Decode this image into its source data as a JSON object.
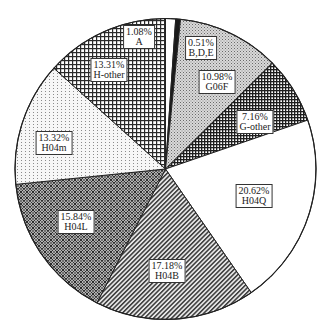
{
  "chart_data": {
    "type": "pie",
    "title": "",
    "start_angle_deg": 0,
    "direction": "clockwise",
    "categories": [
      "A",
      "B,D,E",
      "G06F",
      "G-other",
      "H04Q",
      "H04B",
      "H04L",
      "H04m",
      "H-other"
    ],
    "values": [
      1.08,
      0.51,
      10.98,
      7.16,
      20.62,
      17.18,
      15.84,
      13.32,
      13.31
    ],
    "value_labels": [
      "1.08%",
      "0.51%",
      "10.98%",
      "7.16%",
      "20.62%",
      "17.18%",
      "15.84%",
      "13.32%",
      "13.31%"
    ],
    "fills": [
      "white",
      "black",
      "fine-dots-gray",
      "dense-grid-dark",
      "white",
      "diagonal-hatch",
      "diamond-lattice",
      "sparse-dots",
      "square-grid"
    ],
    "legend": "none",
    "slices": [
      {
        "name": "A",
        "value": 1.08,
        "pct_label": "1.08%",
        "label_pos": [
          139,
          37
        ]
      },
      {
        "name": "B,D,E",
        "value": 0.51,
        "pct_label": "0.51%",
        "label_pos": [
          201,
          48
        ]
      },
      {
        "name": "G06F",
        "value": 10.98,
        "pct_label": "10.98%",
        "label_pos": [
          217,
          82
        ]
      },
      {
        "name": "G-other",
        "value": 7.16,
        "pct_label": "7.16%",
        "label_pos": [
          255,
          122
        ]
      },
      {
        "name": "H04Q",
        "value": 20.62,
        "pct_label": "20.62%",
        "label_pos": [
          254,
          196
        ]
      },
      {
        "name": "H04B",
        "value": 17.18,
        "pct_label": "17.18%",
        "label_pos": [
          167,
          271
        ]
      },
      {
        "name": "H04L",
        "value": 15.84,
        "pct_label": "15.84%",
        "label_pos": [
          76,
          222
        ]
      },
      {
        "name": "H04m",
        "value": 13.32,
        "pct_label": "13.32%",
        "label_pos": [
          54,
          143
        ]
      },
      {
        "name": "H-other",
        "value": 13.31,
        "pct_label": "13.31%",
        "label_pos": [
          109,
          70
        ]
      }
    ]
  }
}
